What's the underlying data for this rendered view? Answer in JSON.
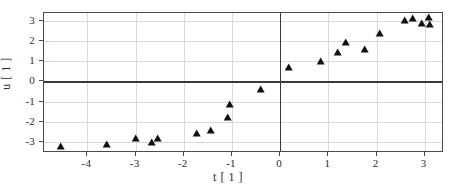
{
  "chart_data": {
    "type": "scatter",
    "title": "",
    "xlabel": "t [ 1 ]",
    "ylabel": "u [ 1 ]",
    "xlim": [
      -4.9,
      3.4
    ],
    "ylim": [
      -3.55,
      3.4
    ],
    "xticks": [
      -4,
      -3,
      -2,
      -1,
      0,
      1,
      2,
      3
    ],
    "yticks": [
      3,
      2,
      1,
      0,
      -1,
      -2,
      -3
    ],
    "xticklabels": [
      "-4",
      "-3",
      "-2",
      "-1",
      "0",
      "1",
      "2",
      "3"
    ],
    "yticklabels": [
      "3",
      "2",
      "1",
      "0",
      "-1",
      "-2",
      "-3"
    ],
    "grid": true,
    "legend": false,
    "marker": "triangle-up",
    "marker_color": "#111111",
    "series": [
      {
        "name": "u(t)",
        "points": [
          {
            "x": -4.55,
            "y": -3.25
          },
          {
            "x": -3.6,
            "y": -3.15
          },
          {
            "x": -3.0,
            "y": -2.87
          },
          {
            "x": -2.66,
            "y": -3.05
          },
          {
            "x": -2.54,
            "y": -2.87
          },
          {
            "x": -1.72,
            "y": -2.6
          },
          {
            "x": -1.43,
            "y": -2.45
          },
          {
            "x": -1.08,
            "y": -1.83
          },
          {
            "x": -1.05,
            "y": -1.15
          },
          {
            "x": -0.4,
            "y": -0.42
          },
          {
            "x": 0.18,
            "y": 0.68
          },
          {
            "x": 0.85,
            "y": 0.95
          },
          {
            "x": 1.2,
            "y": 1.43
          },
          {
            "x": 1.37,
            "y": 1.92
          },
          {
            "x": 1.76,
            "y": 1.57
          },
          {
            "x": 2.08,
            "y": 2.38
          },
          {
            "x": 2.6,
            "y": 2.98
          },
          {
            "x": 2.75,
            "y": 3.12
          },
          {
            "x": 2.94,
            "y": 2.83
          },
          {
            "x": 3.08,
            "y": 3.15
          },
          {
            "x": 3.1,
            "y": 2.82
          }
        ]
      }
    ]
  }
}
